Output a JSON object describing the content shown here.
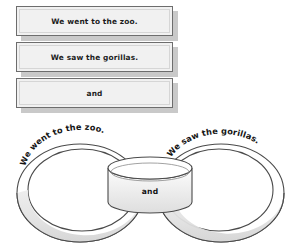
{
  "document": {
    "title": "Paper Chain Sentence Activity"
  },
  "strips": {
    "items": [
      {
        "id": "strip-1",
        "text": "We went to the zoo."
      },
      {
        "id": "strip-2",
        "text": "We saw the gorillas."
      },
      {
        "id": "strip-3",
        "text": "and"
      }
    ]
  },
  "chain": {
    "left_loop": {
      "text": "We went to the zoo."
    },
    "center_loop": {
      "text": "and"
    },
    "right_loop": {
      "text": "We saw the gorillas."
    }
  },
  "colors": {
    "paper_fill": "#f1f1f1",
    "paper_outline": "#6d6d6d",
    "paper_shadow": "#c9c9c9",
    "ring_outline": "#4a4a4a",
    "ring_band_fill": "#e3e3e3",
    "ring_band_shade": "#d2d2d2",
    "text": "#141414",
    "background": "#ffffff"
  }
}
